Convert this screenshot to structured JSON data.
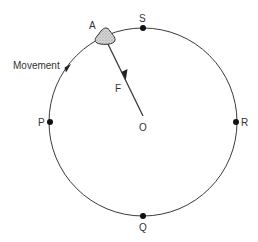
{
  "diagram": {
    "colors": {
      "line": "#3a3a3a",
      "point": "#111111",
      "object_fill": "#cfcfcf",
      "object_stroke": "#333333",
      "text": "#333333"
    },
    "labels": {
      "object": "A",
      "force": "F",
      "center": "O",
      "movement": "Movement",
      "points": {
        "top": "S",
        "left": "P",
        "right": "R",
        "bottom": "Q"
      }
    },
    "object_semantics": "stone-icon",
    "force_direction": "toward-center",
    "movement_direction": "counterclockwise"
  }
}
